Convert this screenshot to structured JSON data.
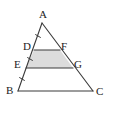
{
  "figure": {
    "name": "triangle-with-two-parallel-cevian-lines",
    "background_color": "#ffffff",
    "stroke_color": "#3a3a3a",
    "shade_color": "#dcdcdc",
    "label_color": "#1c1c1c",
    "width": 115,
    "height": 115
  },
  "points": {
    "A": {
      "label": "A",
      "x": 42,
      "y": 23,
      "label_x": 39,
      "label_y": 9
    },
    "B": {
      "label": "B",
      "x": 18,
      "y": 91,
      "label_x": 6,
      "label_y": 85
    },
    "C": {
      "label": "C",
      "x": 93,
      "y": 91,
      "label_x": 96,
      "label_y": 86
    },
    "D": {
      "label": "D",
      "x": 34,
      "y": 50,
      "label_x": 23,
      "label_y": 41
    },
    "F": {
      "label": "F",
      "x": 60,
      "y": 50,
      "label_x": 61,
      "label_y": 41
    },
    "E": {
      "label": "E",
      "x": 26,
      "y": 68,
      "label_x": 14,
      "label_y": 59
    },
    "G": {
      "label": "G",
      "x": 73,
      "y": 68,
      "label_x": 74,
      "label_y": 59
    }
  },
  "segments": [
    {
      "name": "side-AB",
      "from": "A",
      "to": "B"
    },
    {
      "name": "side-AC",
      "from": "A",
      "to": "C"
    },
    {
      "name": "side-BC",
      "from": "B",
      "to": "C"
    },
    {
      "name": "line-DF",
      "from": "D",
      "to": "F"
    },
    {
      "name": "line-EG",
      "from": "E",
      "to": "G"
    }
  ],
  "shaded_region": {
    "name": "trapezoid-DFGE",
    "vertices": [
      "D",
      "F",
      "G",
      "E"
    ],
    "fill": "#dcdcdc"
  },
  "tick_marks": {
    "description": "single tick on each of AD, DE, EB along side AB",
    "marks": [
      {
        "name": "tick-AD",
        "cx": 38,
        "cy": 36
      },
      {
        "name": "tick-DE",
        "cx": 30,
        "cy": 59
      },
      {
        "name": "tick-EB",
        "cx": 22,
        "cy": 79
      }
    ]
  }
}
